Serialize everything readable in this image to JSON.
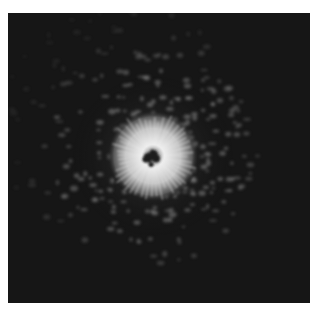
{
  "image": {
    "description": "grayscale speckle/diffraction pattern with bright radial starburst near center-left on dark background",
    "colors": {
      "background": "#161616",
      "page": "#ffffff",
      "core": "#f2f2f2",
      "speckle": "#9a9a9a"
    },
    "center": {
      "x": 145,
      "y": 143
    },
    "glow_radius": 42
  }
}
